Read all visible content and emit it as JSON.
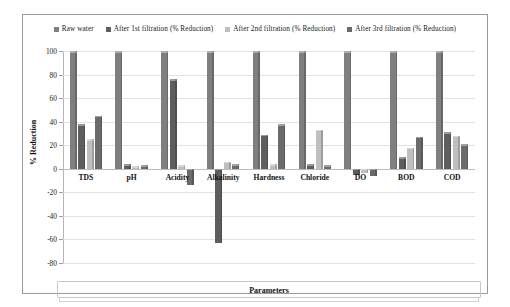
{
  "chart_data": {
    "type": "bar",
    "title": "",
    "xlabel": "Parameters",
    "ylabel": "% Reduction",
    "ylim": [
      -80,
      100
    ],
    "yticks": [
      100,
      80,
      60,
      40,
      20,
      0,
      -20,
      -40,
      -60,
      -80
    ],
    "grid": true,
    "legend_position": "top",
    "categories": [
      "TDS",
      "pH",
      "Acidity",
      "Alkalinity",
      "Hardness",
      "Chloride",
      "DO",
      "BOD",
      "COD"
    ],
    "series": [
      {
        "name": "Raw water",
        "color": "#7f7f7f",
        "values": [
          100,
          100,
          100,
          100,
          100,
          100,
          100,
          100,
          100
        ]
      },
      {
        "name": "After 1st  filtration (% Reduction)",
        "color": "#5e5e5e",
        "values": [
          38,
          4,
          76,
          -63,
          29,
          4,
          -5,
          10,
          31
        ]
      },
      {
        "name": "After 2nd   filtration (% Reduction)",
        "color": "#bfbfbf",
        "values": [
          25,
          2,
          3,
          6,
          4,
          33,
          -4,
          18,
          28
        ]
      },
      {
        "name": "After 3rd filtration (% Reduction)",
        "color": "#6b6b6b",
        "values": [
          45,
          3,
          -14,
          4,
          38,
          3,
          -6,
          27,
          21
        ]
      }
    ]
  },
  "colors": {
    "frame": "#9a9a9a",
    "gridline": "#e2e2e2",
    "zero_line": "#bdbdbd",
    "text": "#1a1a1a"
  }
}
